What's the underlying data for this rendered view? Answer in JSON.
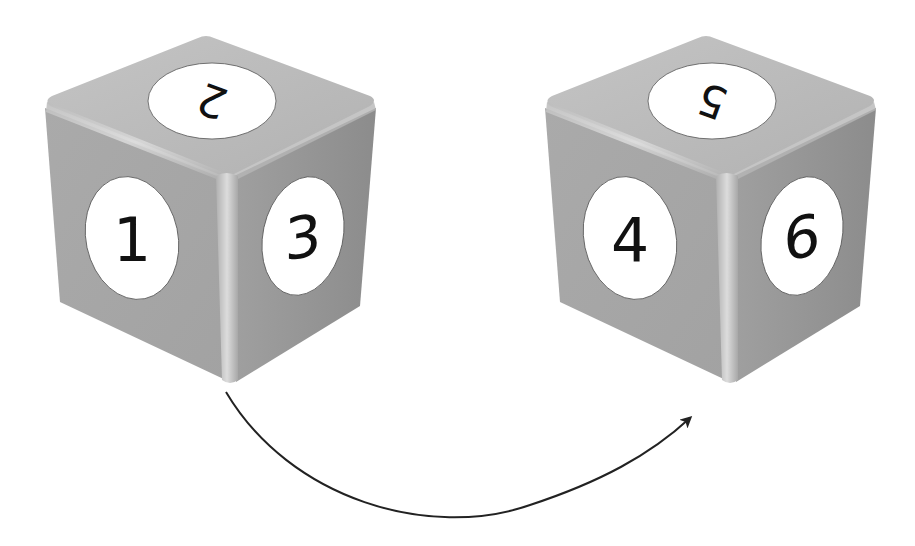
{
  "diagram": {
    "colors": {
      "background": "#ffffff",
      "cube_top": "#b9b9b9",
      "cube_left": "#a6a6a6",
      "cube_right": "#9a9a9a",
      "cube_edge_highlight": "#d6d6d6",
      "face_circle": "#ffffff",
      "numeral": "#111111",
      "arrow": "#222222"
    },
    "cubes": [
      {
        "id": "left-cube",
        "faces": {
          "top": "2",
          "left": "1",
          "right": "3"
        }
      },
      {
        "id": "right-cube",
        "faces": {
          "top": "5",
          "left": "4",
          "right": "6"
        }
      }
    ],
    "arrow": {
      "from": "left-cube",
      "to": "right-cube",
      "shape": "curved-downward-arc"
    }
  }
}
